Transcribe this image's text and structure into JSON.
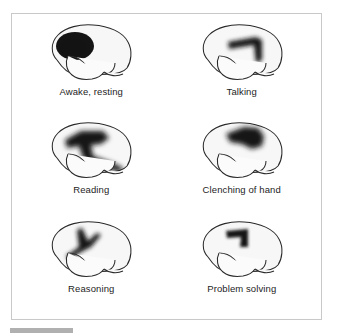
{
  "figure": {
    "panel_count": 6,
    "border_color": "#c9c9c9",
    "background_color": "#ffffff",
    "activation_color": "#141414",
    "brain_fill_color": "#f7f7f7",
    "brain_outline_color": "#2a2a2a"
  },
  "panels": [
    {
      "id": "awake-resting",
      "label": "Awake, resting",
      "activation_region": "frontal lobe",
      "activation_intensity": "high",
      "blur": 7
    },
    {
      "id": "talking",
      "label": "Talking",
      "activation_region": "motor cortex and Broca's area",
      "activation_intensity": "high",
      "blur": 4
    },
    {
      "id": "reading",
      "label": "Reading",
      "activation_region": "frontal to temporal, visual association",
      "activation_intensity": "high",
      "blur": 5
    },
    {
      "id": "clenching-of-hand",
      "label": "Clenching of hand",
      "activation_region": "primary motor cortex, hand area",
      "activation_intensity": "high",
      "blur": 5
    },
    {
      "id": "reasoning",
      "label": "Reasoning",
      "activation_region": "prefrontal cortex",
      "activation_intensity": "medium",
      "blur": 4
    },
    {
      "id": "problem-solving",
      "label": "Problem solving",
      "activation_region": "dorsolateral prefrontal cortex",
      "activation_intensity": "medium",
      "blur": 3
    }
  ],
  "bottom_bar": {
    "color": "#b0b0b0"
  }
}
